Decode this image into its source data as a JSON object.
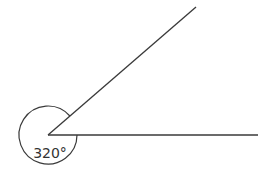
{
  "diagram": {
    "type": "angle",
    "angle_label": "320°",
    "angle_degrees": 320,
    "colors": {
      "stroke": "#3a3a3a",
      "background": "#ffffff"
    }
  }
}
